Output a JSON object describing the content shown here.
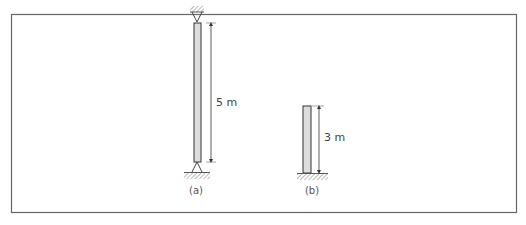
{
  "diagram": {
    "columns": [
      {
        "id": "a",
        "caption": "(a)",
        "length_label": "5 m",
        "top_support": "pinned",
        "bottom_support": "pinned"
      },
      {
        "id": "b",
        "caption": "(b)",
        "length_label": "3 m",
        "top_support": "free",
        "bottom_support": "fixed"
      }
    ]
  }
}
